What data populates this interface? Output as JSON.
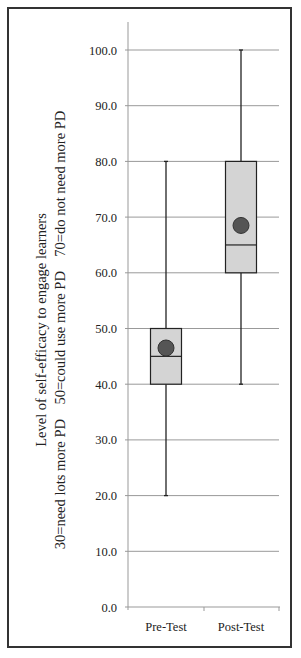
{
  "chart_data": {
    "type": "boxplot",
    "title": "",
    "xlabel": "",
    "ylabel": "Level of self-efficacy  to engage learners",
    "ylabel_line2": "30=need lots more PD    50=could use more PD    70=do not need more PD",
    "ylim": [
      0,
      100
    ],
    "yticks": [
      "0.0",
      "10.0",
      "20.0",
      "30.0",
      "40.0",
      "50.0",
      "60.0",
      "70.0",
      "80.0",
      "90.0",
      "100.0"
    ],
    "grid": true,
    "categories": [
      "Pre-Test",
      "Post-Test"
    ],
    "series": [
      {
        "name": "Pre-Test",
        "min": 20,
        "q1": 40,
        "median": 45,
        "q3": 50,
        "max": 80,
        "mean": 46.5
      },
      {
        "name": "Post-Test",
        "min": 40,
        "q1": 60,
        "median": 65,
        "q3": 80,
        "max": 100,
        "mean": 68.5
      }
    ],
    "colors": {
      "box_fill": "#d4d4d4",
      "mean_marker": "#555555",
      "line": "#222222",
      "grid": "#999999"
    }
  }
}
